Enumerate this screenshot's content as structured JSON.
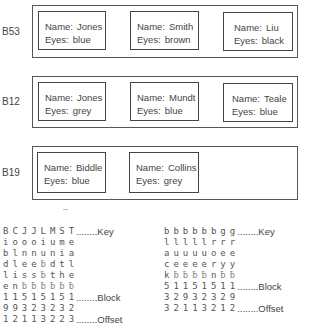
{
  "blocks": [
    {
      "label": "B53",
      "records": [
        {
          "name_key": "Name:",
          "name": "Jones",
          "eyes_key": "Eyes:",
          "eyes": "blue"
        },
        {
          "name_key": "Name:",
          "name": "Smith",
          "eyes_key": "Eyes:",
          "eyes": "brown"
        },
        {
          "name_key": "Name:",
          "name": "Liu",
          "eyes_key": "Eyes:",
          "eyes": "black"
        }
      ]
    },
    {
      "label": "B12",
      "records": [
        {
          "name_key": "Name:",
          "name": "Jones",
          "eyes_key": "Eyes:",
          "eyes": "grey"
        },
        {
          "name_key": "Name:",
          "name": "Mundt",
          "eyes_key": "Eyes:",
          "eyes": "blue"
        },
        {
          "name_key": "Name:",
          "name": "Teale",
          "eyes_key": "Eyes:",
          "eyes": "blue"
        }
      ]
    },
    {
      "label": "B19",
      "records": [
        {
          "name_key": "Name:",
          "name": "Biddle",
          "eyes_key": "Eyes:",
          "eyes": "blue"
        },
        {
          "name_key": "Name:",
          "name": "Collins",
          "eyes_key": "Eyes:",
          "eyes": "grey"
        }
      ]
    }
  ],
  "name_index": {
    "rows": [
      [
        "B",
        "C",
        "J",
        "J",
        "L",
        "M",
        "S",
        "T"
      ],
      [
        "i",
        "o",
        "o",
        "o",
        "i",
        "u",
        "m",
        "e"
      ],
      [
        "b",
        "l",
        "n",
        "n",
        "u",
        "n",
        "i",
        "a"
      ],
      [
        "d",
        "l",
        "e",
        "e",
        "ƀ",
        "d",
        "t",
        "l"
      ],
      [
        "l",
        "i",
        "s",
        "s",
        "ƀ",
        "t",
        "h",
        "e"
      ],
      [
        "e",
        "n",
        "ƀ",
        "ƀ",
        "ƀ",
        "ƀ",
        "ƀ",
        "ƀ"
      ],
      [
        "1",
        "1",
        "5",
        "1",
        "5",
        "1",
        "5",
        "1"
      ],
      [
        "9",
        "9",
        "3",
        "2",
        "3",
        "2",
        "3",
        "2"
      ],
      [
        "1",
        "2",
        "1",
        "1",
        "3",
        "2",
        "2",
        "3"
      ]
    ],
    "tags": {
      "key": "........Key",
      "block": "........Block",
      "offset": "........Offset"
    }
  },
  "eyes_index": {
    "rows": [
      [
        "b",
        "b",
        "b",
        "b",
        "b",
        "b",
        "g",
        "g"
      ],
      [
        "l",
        "l",
        "l",
        "l",
        "l",
        "r",
        "r",
        "r"
      ],
      [
        "a",
        "u",
        "u",
        "u",
        "u",
        "o",
        "e",
        "e"
      ],
      [
        "c",
        "e",
        "e",
        "e",
        "e",
        "r",
        "y",
        "y"
      ],
      [
        "k",
        "ƀ",
        "ƀ",
        "ƀ",
        "ƀ",
        "n",
        "ƀ",
        "ƀ"
      ],
      [
        "5",
        "1",
        "1",
        "5",
        "1",
        "5",
        "1",
        "1"
      ],
      [
        "3",
        "2",
        "9",
        "3",
        "2",
        "3",
        "2",
        "9"
      ],
      [
        "3",
        "2",
        "1",
        "1",
        "3",
        "2",
        "1",
        "2"
      ]
    ],
    "tags": {
      "key": "........Key",
      "block": "........Block",
      "offset": "........Offset"
    }
  }
}
